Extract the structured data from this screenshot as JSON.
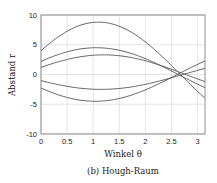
{
  "chart_data": {
    "type": "line",
    "title": "",
    "caption": "(b) Hough-Raum",
    "xlabel": "Winkel θ",
    "ylabel": "Abstand r",
    "xlim": [
      0,
      3.14159
    ],
    "ylim": [
      -10,
      10
    ],
    "xticks": [
      0,
      0.5,
      1,
      1.5,
      2,
      2.5,
      3
    ],
    "xtick_labels": [
      "0",
      "0.5",
      "1",
      "1.5",
      "2",
      "2.5",
      "3"
    ],
    "yticks": [
      10,
      5,
      0,
      -5,
      -10
    ],
    "ytick_labels": [
      "10",
      "5",
      "0",
      "-5",
      "-10"
    ],
    "grid": true,
    "legend": null,
    "line_color": "#555555",
    "annotation": "All curves intersect near θ ≈ 2.65, r ≈ 0.2",
    "series": [
      {
        "name": "curve-1",
        "amplitude": 8.8,
        "phase": 1.1,
        "x": [
          0,
          0.5,
          1,
          1.5,
          2,
          2.5,
          3,
          3.14
        ],
        "values": [
          4.0,
          7.3,
          8.8,
          8.1,
          5.5,
          1.6,
          -2.8,
          -4.0
        ]
      },
      {
        "name": "curve-2",
        "amplitude": 4.5,
        "phase": 1.06,
        "x": [
          0,
          0.5,
          1,
          1.5,
          2,
          2.5,
          3,
          3.14
        ],
        "values": [
          2.2,
          3.8,
          4.5,
          4.1,
          2.6,
          0.6,
          -1.6,
          -2.2
        ]
      },
      {
        "name": "curve-3",
        "amplitude": 3.3,
        "phase": 1.2,
        "x": [
          0,
          0.5,
          1,
          1.5,
          2,
          2.5,
          3,
          3.14
        ],
        "values": [
          1.2,
          2.5,
          3.2,
          3.1,
          2.3,
          0.9,
          -0.8,
          -1.2
        ]
      },
      {
        "name": "curve-4",
        "amplitude": -2.5,
        "phase": 1.15,
        "x": [
          0,
          0.5,
          1,
          1.5,
          2,
          2.5,
          3,
          3.14
        ],
        "values": [
          -1.0,
          -2.0,
          -2.5,
          -2.3,
          -1.6,
          -0.5,
          0.7,
          1.0
        ]
      },
      {
        "name": "curve-5",
        "amplitude": -4.5,
        "phase": 1.04,
        "x": [
          0,
          0.5,
          1,
          1.5,
          2,
          2.5,
          3,
          3.14
        ],
        "values": [
          -2.3,
          -3.8,
          -4.5,
          -4.0,
          -2.6,
          -0.5,
          1.7,
          2.3
        ]
      }
    ]
  }
}
